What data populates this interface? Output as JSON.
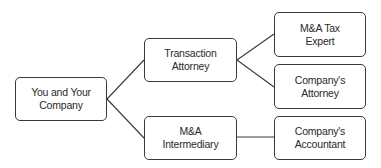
{
  "diagram": {
    "type": "org-chart",
    "nodes": [
      {
        "id": "you",
        "lines": [
          "You and Your",
          "Company"
        ]
      },
      {
        "id": "transaction_attorney",
        "lines": [
          "Transaction",
          "Attorney"
        ]
      },
      {
        "id": "ma_intermediary",
        "lines": [
          "M&A",
          "Intermediary"
        ]
      },
      {
        "id": "ma_tax_expert",
        "lines": [
          "M&A Tax",
          "Expert"
        ]
      },
      {
        "id": "company_attorney",
        "lines": [
          "Company's",
          "Attorney"
        ]
      },
      {
        "id": "company_accountant",
        "lines": [
          "Company's",
          "Accountant"
        ]
      }
    ],
    "edges": [
      {
        "from": "you",
        "to": "transaction_attorney"
      },
      {
        "from": "you",
        "to": "ma_intermediary"
      },
      {
        "from": "transaction_attorney",
        "to": "ma_tax_expert"
      },
      {
        "from": "transaction_attorney",
        "to": "company_attorney"
      },
      {
        "from": "ma_intermediary",
        "to": "company_accountant"
      }
    ],
    "colors": {
      "stroke": "#3a3a3a",
      "text": "#2a2a2a",
      "background": "#ffffff"
    }
  }
}
